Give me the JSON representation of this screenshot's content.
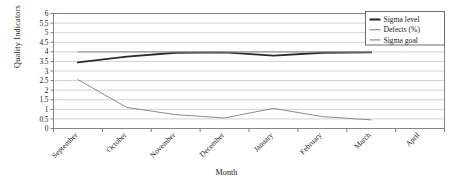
{
  "chart_data": {
    "type": "line",
    "title": "",
    "xlabel": "Month",
    "ylabel": "Quality Indicators",
    "categories": [
      "September",
      "October",
      "November",
      "December",
      "January",
      "February",
      "March",
      "April"
    ],
    "ylim": [
      0,
      6
    ],
    "ytick_labels": [
      "0",
      "0.5",
      "1",
      "1.5",
      "2",
      "2.5",
      "3",
      "3.5",
      "4",
      "4.5",
      "5",
      "5.5",
      "6"
    ],
    "ytick_values": [
      0,
      0.5,
      1,
      1.5,
      2,
      2.5,
      3,
      3.5,
      4,
      4.5,
      5,
      5.5,
      6
    ],
    "grid": "horizontal",
    "legend_position": "top-right",
    "series": [
      {
        "name": "Sigma level",
        "color": "#2b2b2b",
        "width": 1.9,
        "values": [
          3.45,
          3.75,
          3.95,
          3.97,
          3.8,
          3.95,
          3.98,
          null
        ]
      },
      {
        "name": "Defects (%)",
        "color": "#8c8c8c",
        "width": 1.0,
        "values": [
          2.55,
          1.1,
          0.72,
          0.55,
          1.05,
          0.62,
          0.45,
          null
        ]
      },
      {
        "name": "Sigma goal",
        "color": "#9a9a9a",
        "width": 1.1,
        "values": [
          4,
          4,
          4,
          4,
          4,
          4,
          4,
          null
        ]
      }
    ]
  },
  "axes": {
    "y_title": "Quality Indicators",
    "x_title": "Month"
  },
  "legend": {
    "items": [
      {
        "label": "Sigma level"
      },
      {
        "label": "Defects (%)"
      },
      {
        "label": "Sigma goal"
      }
    ]
  },
  "colors": {
    "grid": "#bfbfbf",
    "axis": "#6f6f6f",
    "frame": "#7a7a7a",
    "background": "#ffffff",
    "sigma_level": "#2b2b2b",
    "defects": "#8c8c8c",
    "sigma_goal": "#9a9a9a"
  }
}
